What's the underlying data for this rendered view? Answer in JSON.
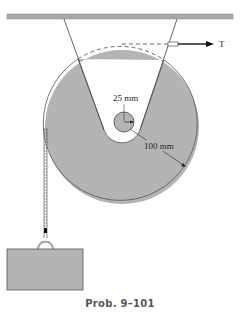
{
  "figure": {
    "caption": "Prob. 9–101",
    "labels": {
      "hub_radius": "25 mm",
      "disk_radius": "100 mm",
      "force": "T"
    }
  },
  "colors": {
    "disk_fill": "#b4b4b4",
    "ceiling_fill": "#a8a8a8",
    "block_fill": "#b4b4b4",
    "line": "#333333"
  }
}
